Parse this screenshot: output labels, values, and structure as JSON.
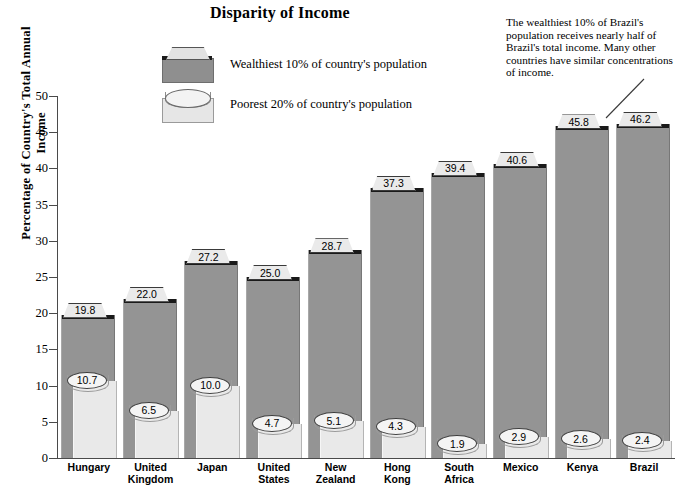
{
  "chart_data": {
    "type": "bar",
    "title": "Disparity of Income",
    "xlabel": "",
    "ylabel": "Percentage of Country's Total Annual Income",
    "ylim": [
      0,
      50
    ],
    "ytick_step": 5,
    "yticks": [
      "50",
      "45",
      "40",
      "35",
      "30",
      "25",
      "20",
      "15",
      "10",
      "5",
      "0"
    ],
    "grid": false,
    "legend_position": "top-center",
    "categories": [
      "Hungary",
      "United Kingdom",
      "Japan",
      "United States",
      "New Zealand",
      "Hong Kong",
      "South Africa",
      "Mexico",
      "Kenya",
      "Brazil"
    ],
    "category_lines": [
      [
        "Hungary"
      ],
      [
        "United",
        "Kingdom"
      ],
      [
        "Japan"
      ],
      [
        "United",
        "States"
      ],
      [
        "New",
        "Zealand"
      ],
      [
        "Hong",
        "Kong"
      ],
      [
        "South",
        "Africa"
      ],
      [
        "Mexico"
      ],
      [
        "Kenya"
      ],
      [
        "Brazil"
      ]
    ],
    "series": [
      {
        "name": "Wealthiest 10% of country's population",
        "values": [
          19.8,
          22.0,
          27.2,
          25.0,
          28.7,
          37.3,
          39.4,
          40.6,
          45.8,
          46.2
        ],
        "labels": [
          "19.8",
          "22.0",
          "27.2",
          "25.0",
          "28.7",
          "37.3",
          "39.4",
          "40.6",
          "45.8",
          "46.2"
        ],
        "color": "#949494"
      },
      {
        "name": "Poorest 20% of country's population",
        "values": [
          10.7,
          6.5,
          10.0,
          4.7,
          5.1,
          4.3,
          1.9,
          2.9,
          2.6,
          2.4
        ],
        "labels": [
          "10.7",
          "6.5",
          "10.0",
          "4.7",
          "5.1",
          "4.3",
          "1.9",
          "2.9",
          "2.6",
          "2.4"
        ],
        "color": "#e9e9e9"
      }
    ],
    "annotations": [
      {
        "text": "The wealthiest 10% of Brazil's population receives nearly half of Brazil's total income.  Many other countries have similar concentrations of income.",
        "target": "Brazil"
      }
    ]
  },
  "legend": {
    "items": [
      {
        "label": "Wealthiest 10% of country's population",
        "icon": "wealthy-bar-swatch"
      },
      {
        "label": "Poorest 20% of country's population",
        "icon": "poorest-bar-swatch"
      }
    ]
  }
}
